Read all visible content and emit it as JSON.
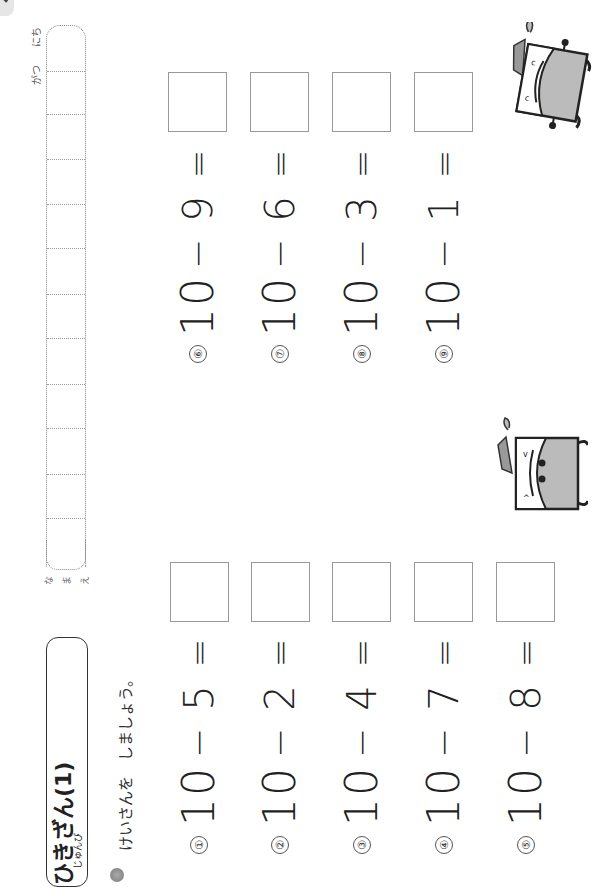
{
  "page": {
    "orientation": "rotated-90-ccw",
    "title": "ひきざん(1)",
    "title_ruby": "じゅんび",
    "instruction": "けいさんを　しましょう。",
    "name_label": [
      "な",
      "ま",
      "え"
    ],
    "date_labels": {
      "month": "がつ",
      "day": "にち"
    }
  },
  "problems": [
    {
      "id": "①",
      "minuend": "10",
      "op": "−",
      "subtrahend": "5",
      "eq": "=",
      "answer": ""
    },
    {
      "id": "②",
      "minuend": "10",
      "op": "−",
      "subtrahend": "2",
      "eq": "=",
      "answer": ""
    },
    {
      "id": "③",
      "minuend": "10",
      "op": "−",
      "subtrahend": "4",
      "eq": "=",
      "answer": ""
    },
    {
      "id": "④",
      "minuend": "10",
      "op": "−",
      "subtrahend": "7",
      "eq": "=",
      "answer": ""
    },
    {
      "id": "⑤",
      "minuend": "10",
      "op": "−",
      "subtrahend": "8",
      "eq": "=",
      "answer": ""
    },
    {
      "id": "⑥",
      "minuend": "10",
      "op": "−",
      "subtrahend": "9",
      "eq": "=",
      "answer": ""
    },
    {
      "id": "⑦",
      "minuend": "10",
      "op": "−",
      "subtrahend": "6",
      "eq": "=",
      "answer": ""
    },
    {
      "id": "⑧",
      "minuend": "10",
      "op": "−",
      "subtrahend": "3",
      "eq": "=",
      "answer": ""
    },
    {
      "id": "⑨",
      "minuend": "10",
      "op": "−",
      "subtrahend": "1",
      "eq": "=",
      "answer": ""
    }
  ],
  "colors": {
    "ink": "#222222",
    "box_border": "#999999",
    "mascot_gray": "#b8b8b8",
    "tab_gray": "#e6e6e6"
  }
}
